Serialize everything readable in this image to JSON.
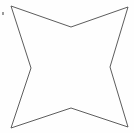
{
  "figure": {
    "name": "four-pointed-star",
    "background_color": "#fefefe",
    "stroke_color": "#4a4a4a",
    "stroke_width": 0.9,
    "fill": "none",
    "canvas": {
      "width": 134,
      "height": 133
    },
    "outer_points": [
      {
        "label": "top-left",
        "x": 11,
        "y": 6
      },
      {
        "label": "top-right",
        "x": 128,
        "y": 7
      },
      {
        "label": "bottom-right",
        "x": 128,
        "y": 127
      },
      {
        "label": "bottom-left",
        "x": 11,
        "y": 128
      }
    ],
    "inner_points": [
      {
        "label": "top",
        "x": 71,
        "y": 27
      },
      {
        "label": "right",
        "x": 110,
        "y": 67
      },
      {
        "label": "bottom",
        "x": 71,
        "y": 108
      },
      {
        "label": "left",
        "x": 31,
        "y": 68
      }
    ],
    "path": "M 11 6 L 71 27 L 128 7 L 110 67 L 128 127 L 71 108 L 11 128 L 31 68 Z"
  },
  "artifacts": [
    {
      "name": "noise-speck",
      "x": 2,
      "y": 12,
      "color": "#8a8a8a"
    }
  ]
}
